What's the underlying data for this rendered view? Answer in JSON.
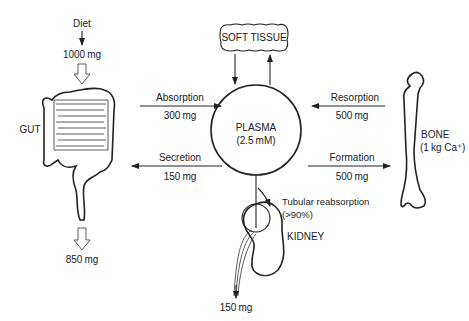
{
  "diagram": {
    "nodes": {
      "diet": {
        "label": "Diet",
        "amount": "1000 mg"
      },
      "gut": {
        "label": "GUT",
        "output": "850 mg"
      },
      "soft_tissue": {
        "label": "SOFT TISSUE"
      },
      "plasma": {
        "label": "PLASMA",
        "concentration": "(2.5 mM)"
      },
      "bone": {
        "label": "BONE",
        "content": "(1 kg Ca⁺)"
      },
      "kidney": {
        "label": "KIDNEY",
        "output": "150 mg"
      }
    },
    "flows": {
      "absorption": {
        "label": "Absorption",
        "amount": "300 mg"
      },
      "secretion": {
        "label": "Secretion",
        "amount": "150 mg"
      },
      "resorption": {
        "label": "Resorption",
        "amount": "500 mg"
      },
      "formation": {
        "label": "Formation",
        "amount": "500 mg"
      },
      "tubular_reabsorption": {
        "label": "Tubular reabsorption",
        "amount": "(>90%)"
      }
    }
  }
}
